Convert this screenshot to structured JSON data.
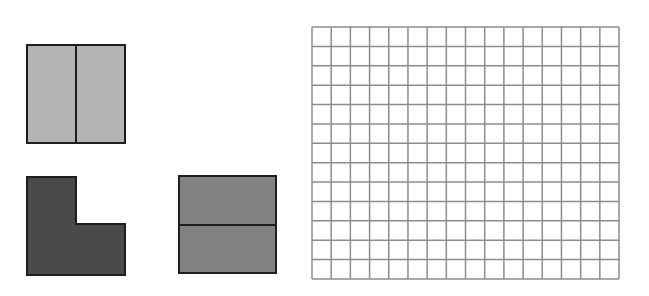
{
  "canvas": {
    "width": 649,
    "height": 296,
    "background": "#ffffff"
  },
  "colors": {
    "outline": "#1e1e1e",
    "light_gray": "#b4b4b4",
    "dark_gray": "#4a4a4a",
    "medium_gray": "#828282",
    "grid_line": "#8c8c8c",
    "grid_fill": "#ffffff"
  },
  "shapes": [
    {
      "name": "vertical-split-square",
      "description": "Square divided into two vertical halves",
      "x": 27,
      "y": 45,
      "width": 98,
      "height": 98,
      "fill": "light_gray",
      "divider": {
        "orientation": "vertical",
        "x": 76
      }
    },
    {
      "name": "l-shape",
      "description": "L-shaped piece (three quarters of a square, top-right quarter removed)",
      "points": [
        [
          27,
          177
        ],
        [
          76,
          177
        ],
        [
          76,
          224
        ],
        [
          125,
          224
        ],
        [
          125,
          275
        ],
        [
          27,
          275
        ]
      ],
      "fill": "dark_gray"
    },
    {
      "name": "horizontal-split-square",
      "description": "Square divided into two horizontal halves",
      "x": 179,
      "y": 176,
      "width": 97,
      "height": 97,
      "fill": "medium_gray",
      "divider": {
        "orientation": "horizontal",
        "y": 225
      }
    }
  ],
  "grid": {
    "x": 312,
    "y": 27,
    "columns": 16,
    "rows": 13,
    "cell_width": 19.19,
    "cell_height": 19.38
  }
}
